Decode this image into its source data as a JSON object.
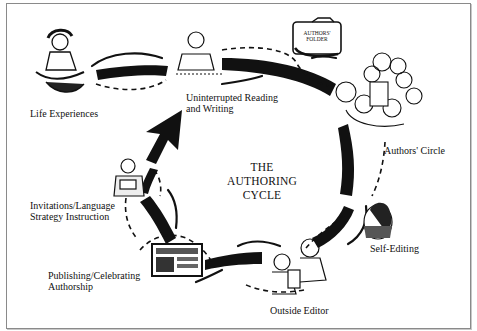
{
  "diagram": {
    "title_lines": [
      "THE",
      "AUTHORING",
      "CYCLE"
    ],
    "stages": [
      {
        "id": "life-experiences",
        "lines": [
          "Life Experiences"
        ]
      },
      {
        "id": "uninterrupted-reading-writing",
        "lines": [
          "Uninterrupted Reading",
          "and Writing"
        ]
      },
      {
        "id": "authors-circle",
        "lines": [
          "Authors' Circle"
        ]
      },
      {
        "id": "self-editing",
        "lines": [
          "Self-Editing"
        ]
      },
      {
        "id": "outside-editor",
        "lines": [
          "Outside Editor"
        ]
      },
      {
        "id": "publishing-celebrating",
        "lines": [
          "Publishing/Celebrating",
          "Authorship"
        ]
      },
      {
        "id": "invitations-language",
        "lines": [
          "Invitations/Language",
          "Strategy Instruction"
        ]
      }
    ],
    "folder_label_lines": [
      "AUTHORS'",
      "FOLDER"
    ],
    "colors": {
      "ink": "#111111",
      "frame": "#8a8a8a",
      "background": "#ffffff"
    }
  }
}
